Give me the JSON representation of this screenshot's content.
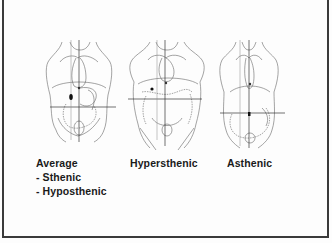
{
  "slide": {
    "figures": [
      {
        "id": "average",
        "label": "Average",
        "sub_items": [
          "- Sthenic",
          "- Hyposthenic"
        ]
      },
      {
        "id": "hypersthenic",
        "label": "Hypersthenic"
      },
      {
        "id": "asthenic",
        "label": "Asthenic"
      }
    ],
    "colors": {
      "line": "#555555",
      "border": "#3a3a3a",
      "text": "#1a1a1a",
      "background": "#fdfdfd"
    }
  }
}
